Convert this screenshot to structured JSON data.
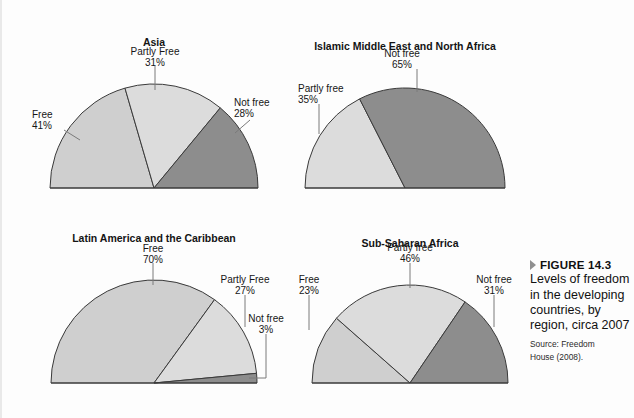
{
  "figure": {
    "marker_icon": "triangle-right-icon",
    "number_label": "FIGURE 14.3",
    "caption": "Levels of freedom in the developing countries, by region, circa 2007",
    "source_line1": "Source: Freedom",
    "source_line2": "House (2008)."
  },
  "colors": {
    "free": "#cfcfcf",
    "partly_free": "#dcdcdc",
    "not_free": "#8d8d8d",
    "outline": "#3a3a3a",
    "leader": "#7a7a7a",
    "text": "#141414",
    "background": "#fdfdfd"
  },
  "chart_data": [
    {
      "type": "pie",
      "variant": "semicircle",
      "title": "Asia",
      "categories": [
        "Free",
        "Partly Free",
        "Not free"
      ],
      "values": [
        41,
        31,
        28
      ],
      "labels": [
        "41%",
        "31%",
        "28%"
      ],
      "colors": [
        "#cfcfcf",
        "#dcdcdc",
        "#8d8d8d"
      ],
      "geometry": {
        "cx": 152,
        "cy": 188,
        "r": 104
      },
      "label_positions": [
        {
          "name": "Free",
          "x": 30,
          "y": 118,
          "anchor": "start",
          "leader": [
            [
              62,
              130
            ],
            [
              78,
              140
            ]
          ]
        },
        {
          "name": "Partly Free",
          "x": 153,
          "y": 55,
          "anchor": "middle",
          "leader": [
            [
              153,
              66
            ],
            [
              153,
              90
            ]
          ]
        },
        {
          "name": "Not free",
          "x": 232,
          "y": 106,
          "anchor": "start",
          "leader": [
            [
              248,
              120
            ],
            [
              233,
              133
            ]
          ]
        }
      ]
    },
    {
      "type": "pie",
      "variant": "semicircle",
      "title": "Islamic Middle East and North Africa",
      "categories": [
        "Partly free",
        "Not free"
      ],
      "values": [
        35,
        65
      ],
      "labels": [
        "35%",
        "65%"
      ],
      "colors": [
        "#dcdcdc",
        "#8d8d8d"
      ],
      "geometry": {
        "cx": 403,
        "cy": 188,
        "r": 100
      },
      "label_positions": [
        {
          "name": "Partly free",
          "x": 296,
          "y": 92,
          "anchor": "start",
          "leader": [
            [
              317,
              104
            ],
            [
              317,
              134
            ]
          ]
        },
        {
          "name": "Not free",
          "x": 400,
          "y": 57,
          "anchor": "middle",
          "leader": [
            [
              415,
              69
            ],
            [
              415,
              92
            ]
          ]
        }
      ]
    },
    {
      "type": "pie",
      "variant": "semicircle",
      "title": "Latin America and the Caribbean",
      "categories": [
        "Free",
        "Partly Free",
        "Not free"
      ],
      "values": [
        70,
        27,
        3
      ],
      "labels": [
        "70%",
        "27%",
        "3%"
      ],
      "colors": [
        "#cfcfcf",
        "#dcdcdc",
        "#8d8d8d"
      ],
      "geometry": {
        "cx": 152,
        "cy": 383,
        "r": 103
      },
      "label_positions": [
        {
          "name": "Free",
          "x": 151,
          "y": 252,
          "anchor": "middle",
          "leader": [
            [
              151,
              263
            ],
            [
              151,
              285
            ]
          ]
        },
        {
          "name": "Partly Free",
          "x": 243,
          "y": 283,
          "anchor": "middle",
          "leader": [
            [
              243,
              295
            ],
            [
              243,
              327
            ]
          ]
        },
        {
          "name": "Not free",
          "x": 264,
          "y": 322,
          "anchor": "middle",
          "leader": [
            [
              264,
              334
            ],
            [
              264,
              378
            ],
            [
              247,
              378
            ]
          ]
        }
      ]
    },
    {
      "type": "pie",
      "variant": "semicircle",
      "title": "Sub-Saharan Africa",
      "categories": [
        "Free",
        "Partly free",
        "Not free"
      ],
      "values": [
        23,
        46,
        31
      ],
      "labels": [
        "23%",
        "46%",
        "31%"
      ],
      "colors": [
        "#cfcfcf",
        "#dcdcdc",
        "#8d8d8d"
      ],
      "geometry": {
        "cx": 408,
        "cy": 383,
        "r": 98
      },
      "label_positions": [
        {
          "name": "Free",
          "x": 307,
          "y": 283,
          "anchor": "middle",
          "leader": [
            [
              307,
              295
            ],
            [
              307,
              330
            ]
          ]
        },
        {
          "name": "Partly free",
          "x": 408,
          "y": 251,
          "anchor": "middle",
          "leader": [
            [
              408,
              263
            ],
            [
              408,
              288
            ]
          ]
        },
        {
          "name": "Not free",
          "x": 492,
          "y": 283,
          "anchor": "middle",
          "leader": [
            [
              492,
              295
            ],
            [
              492,
              327
            ]
          ]
        }
      ]
    }
  ]
}
